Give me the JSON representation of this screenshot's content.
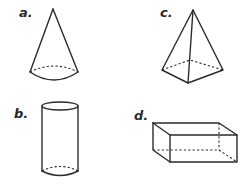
{
  "figure": {
    "shapes": [
      {
        "id": "a",
        "label": "a.",
        "name": "cone"
      },
      {
        "id": "b",
        "label": "b.",
        "name": "cylinder"
      },
      {
        "id": "c",
        "label": "c.",
        "name": "square pyramid"
      },
      {
        "id": "d",
        "label": "d.",
        "name": "rectangular prism"
      }
    ],
    "colors": {
      "stroke": "#2b2b2b",
      "background": "#ffffff"
    }
  }
}
